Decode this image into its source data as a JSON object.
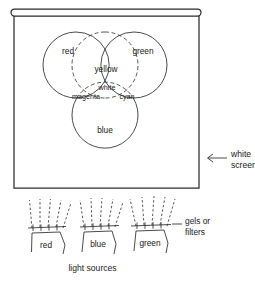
{
  "figure": {
    "screen": {
      "label_line1": "white",
      "label_line2": "screen",
      "arrow_icon": "left-arrow-icon"
    },
    "venn": {
      "circles": [
        {
          "name": "red",
          "label": "red",
          "cx": 76,
          "cy": 65,
          "r": 33
        },
        {
          "name": "green",
          "label": "green",
          "cx": 134,
          "cy": 65,
          "r": 33
        },
        {
          "name": "blue",
          "label": "blue",
          "cx": 105,
          "cy": 115,
          "r": 33
        }
      ],
      "overlaps": [
        {
          "name": "yellow",
          "label": "yellow",
          "of": [
            "red",
            "green"
          ]
        },
        {
          "name": "magenta",
          "label": "magenta",
          "of": [
            "red",
            "blue"
          ]
        },
        {
          "name": "cyan",
          "label": "cyan",
          "of": [
            "green",
            "blue"
          ]
        },
        {
          "name": "white",
          "label": "white",
          "of": [
            "red",
            "green",
            "blue"
          ]
        }
      ]
    },
    "lamps": {
      "caption": "light sources",
      "filters_label_line1": "gels or",
      "filters_label_line2": "filters",
      "items": [
        {
          "name": "red-lamp",
          "label": "red"
        },
        {
          "name": "blue-lamp",
          "label": "blue"
        },
        {
          "name": "green-lamp",
          "label": "green"
        }
      ]
    },
    "colors": {
      "ink": "#2b2b2b",
      "text": "#171717",
      "background": "#ffffff"
    }
  }
}
